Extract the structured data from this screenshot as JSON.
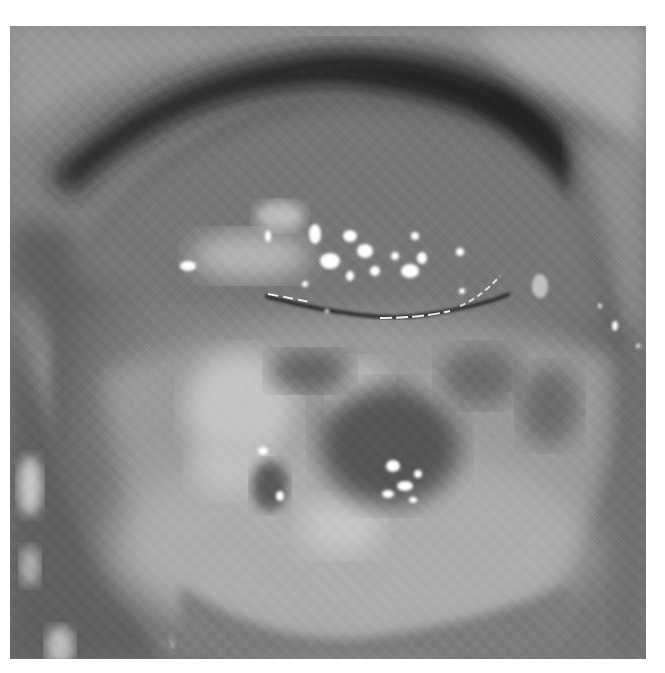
{
  "image": {
    "kind": "grayscale clinical photograph",
    "subject": "cervix viewed through speculum",
    "alt": "Grayscale colposcopic photograph of a cervix with specular highlights, whitish epithelial areas and a horizontal os",
    "colors": {
      "background": "#ffffff",
      "tissue_mid": "#8a8a8a",
      "tissue_dark": "#4a4a4a",
      "speculum_shadow": "#1e1e1e",
      "acetowhite": "#c8c8c8",
      "highlight": "#ffffff"
    }
  }
}
